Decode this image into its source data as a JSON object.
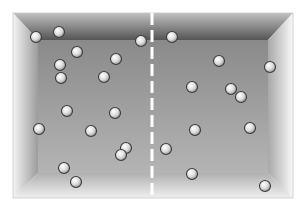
{
  "diagram": {
    "colors": {
      "background": "#ffffff",
      "back_wall": "#8f8f8f",
      "top_wall_dark": "#5a5a5a",
      "top_wall_light": "#b8b8b8",
      "side_wall_light": "#f2f2f2",
      "side_wall_dark": "#9a9a9a",
      "floor_light": "#e6e6e6",
      "floor_dark": "#b5b5b5",
      "divider": "#ffffff",
      "particle_fill": "#e8e8e8",
      "particle_stroke": "#3a3a3a"
    },
    "box": {
      "outer": {
        "x1": 13,
        "y1": 13,
        "x2": 293,
        "y2": 198
      },
      "inner": {
        "x1": 38,
        "y1": 40,
        "x2": 268,
        "y2": 173
      }
    },
    "divider": {
      "x": 152,
      "y1": 13,
      "y2": 198,
      "style": "dashed"
    },
    "particle_radius": 5.5,
    "particles_left": [
      {
        "x": 36,
        "y": 37
      },
      {
        "x": 59,
        "y": 32
      },
      {
        "x": 77,
        "y": 52
      },
      {
        "x": 60,
        "y": 65
      },
      {
        "x": 61,
        "y": 78
      },
      {
        "x": 116,
        "y": 59
      },
      {
        "x": 104,
        "y": 77
      },
      {
        "x": 141,
        "y": 41
      },
      {
        "x": 67,
        "y": 111
      },
      {
        "x": 115,
        "y": 113
      },
      {
        "x": 39,
        "y": 129
      },
      {
        "x": 91,
        "y": 131
      },
      {
        "x": 126,
        "y": 148
      },
      {
        "x": 121,
        "y": 155
      },
      {
        "x": 64,
        "y": 168
      },
      {
        "x": 76,
        "y": 182
      }
    ],
    "particles_right": [
      {
        "x": 172,
        "y": 37
      },
      {
        "x": 219,
        "y": 61
      },
      {
        "x": 270,
        "y": 67
      },
      {
        "x": 192,
        "y": 87
      },
      {
        "x": 231,
        "y": 89
      },
      {
        "x": 241,
        "y": 97
      },
      {
        "x": 195,
        "y": 130
      },
      {
        "x": 250,
        "y": 128
      },
      {
        "x": 166,
        "y": 149
      },
      {
        "x": 192,
        "y": 174
      },
      {
        "x": 265,
        "y": 186
      }
    ],
    "counts": {
      "left": 16,
      "right": 11
    }
  }
}
